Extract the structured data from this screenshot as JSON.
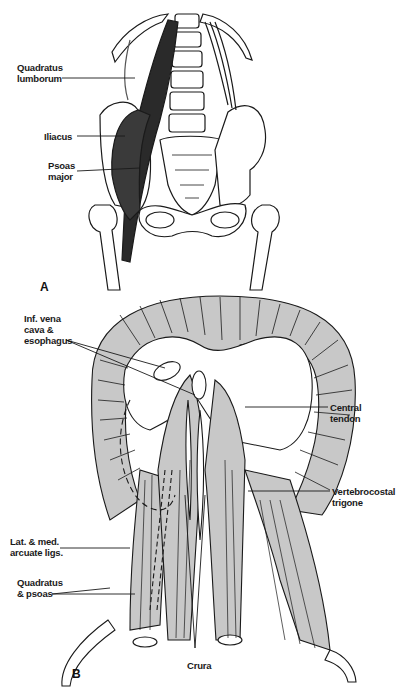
{
  "figure": {
    "panel_a": {
      "letter": "A",
      "labels": {
        "quadratus_lumborum": "Quadratus\nlumborum",
        "iliacus": "Iliacus",
        "psoas_major": "Psoas\nmajor"
      }
    },
    "panel_b": {
      "letter": "B",
      "labels": {
        "ivc_esophagus": "Inf. vena\ncava &\nesophagus",
        "central_tendon": "Central\ntendon",
        "vertebrocostal_trigone": "Vertebrocostal\ntrigone",
        "arcuate_ligs": "Lat. & med.\narcuate ligs.",
        "quadratus_psoas": "Quadratus\n& psoas",
        "crura": "Crura"
      }
    },
    "colors": {
      "line": "#1a1a1a",
      "muscle_fill": "#c8c8c8",
      "tendon_fill": "#ffffff",
      "background": "#ffffff"
    }
  }
}
